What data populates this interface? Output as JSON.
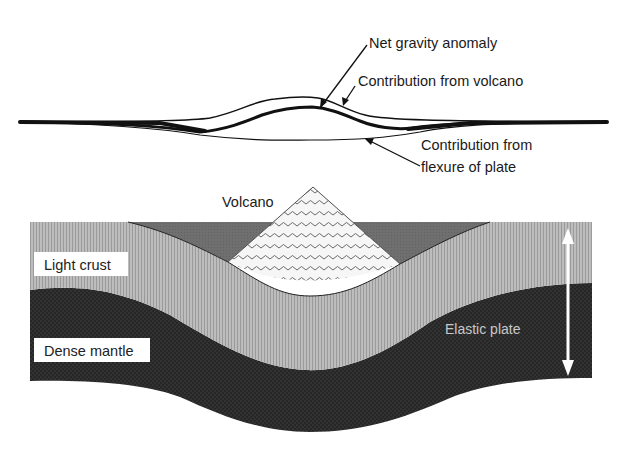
{
  "diagram": {
    "gravity_profile": {
      "labels": {
        "net_anomaly": "Net gravity anomaly",
        "volcano_contribution": "Contribution from volcano",
        "flexure_contribution_line1": "Contribution from",
        "flexure_contribution_line2": "flexure of plate"
      }
    },
    "cross_section": {
      "labels": {
        "volcano": "Volcano",
        "light_crust": "Light crust",
        "dense_mantle": "Dense mantle",
        "elastic_plate": "Elastic plate"
      }
    },
    "colors": {
      "crust": "#b4b4b4",
      "mantle": "#2a2a2a",
      "water": "#6e6e6e",
      "volcano_fill": "#f4f4f4",
      "volcano_pattern": "#707070",
      "line": "#111111"
    }
  }
}
